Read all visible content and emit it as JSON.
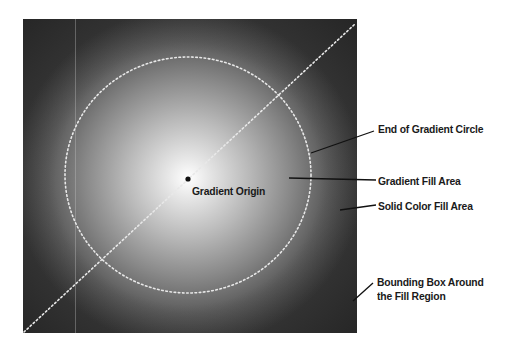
{
  "diagram": {
    "labels": {
      "gradient_origin": "Gradient Origin",
      "end_of_gradient_circle": "End of Gradient Circle",
      "gradient_fill_area": "Gradient Fill Area",
      "solid_color_fill_area": "Solid Color Fill Area",
      "bounding_box_line1": "Bounding Box Around",
      "bounding_box_line2": "the Fill Region"
    },
    "colors": {
      "gradient_center": "#ffffff",
      "gradient_edge": "#3a3a3a",
      "solid_fill": "#2b2b2b",
      "dotted_guide": "#e8e8e8",
      "leader_line": "#111111",
      "label_text": "#1a1a1a"
    }
  }
}
